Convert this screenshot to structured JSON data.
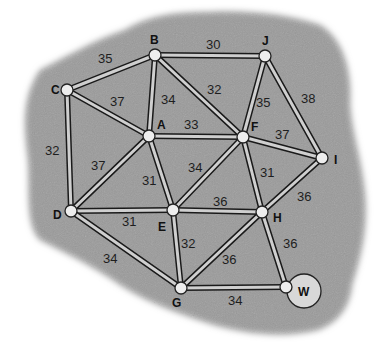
{
  "colors": {
    "background": "#ffffff",
    "region": "#9c9c9c",
    "edge_outline": "#1a1a1a",
    "edge_fill": "#cfcfcf",
    "node_fill": "#ededed"
  },
  "nodes": [
    {
      "id": "B",
      "x": 155,
      "y": 55,
      "lx": 150,
      "ly": 44
    },
    {
      "id": "J",
      "x": 265,
      "y": 56,
      "lx": 262,
      "ly": 45
    },
    {
      "id": "C",
      "x": 67,
      "y": 90,
      "lx": 51,
      "ly": 94
    },
    {
      "id": "A",
      "x": 149,
      "y": 136,
      "lx": 157,
      "ly": 129
    },
    {
      "id": "F",
      "x": 243,
      "y": 137,
      "lx": 251,
      "ly": 131
    },
    {
      "id": "I",
      "x": 322,
      "y": 158,
      "lx": 334,
      "ly": 164
    },
    {
      "id": "D",
      "x": 71,
      "y": 211,
      "lx": 53,
      "ly": 219
    },
    {
      "id": "E",
      "x": 173,
      "y": 210,
      "lx": 158,
      "ly": 231
    },
    {
      "id": "H",
      "x": 262,
      "y": 212,
      "lx": 273,
      "ly": 222
    },
    {
      "id": "G",
      "x": 181,
      "y": 288,
      "lx": 172,
      "ly": 307
    },
    {
      "id": "W",
      "x": 286,
      "y": 287,
      "lx": 298,
      "ly": 296
    }
  ],
  "edges": [
    {
      "from": "C",
      "to": "B",
      "weight": "35",
      "lx": 98,
      "ly": 63
    },
    {
      "from": "B",
      "to": "J",
      "weight": "30",
      "lx": 206,
      "ly": 49
    },
    {
      "from": "C",
      "to": "A",
      "weight": "37",
      "lx": 110,
      "ly": 106
    },
    {
      "from": "B",
      "to": "A",
      "weight": "34",
      "lx": 161,
      "ly": 104
    },
    {
      "from": "B",
      "to": "F",
      "weight": "32",
      "lx": 207,
      "ly": 94
    },
    {
      "from": "J",
      "to": "F",
      "weight": "35",
      "lx": 256,
      "ly": 107
    },
    {
      "from": "J",
      "to": "I",
      "weight": "38",
      "lx": 301,
      "ly": 103
    },
    {
      "from": "A",
      "to": "F",
      "weight": "33",
      "lx": 184,
      "ly": 129
    },
    {
      "from": "F",
      "to": "I",
      "weight": "37",
      "lx": 275,
      "ly": 139
    },
    {
      "from": "C",
      "to": "D",
      "weight": "32",
      "lx": 45,
      "ly": 155
    },
    {
      "from": "A",
      "to": "D",
      "weight": "37",
      "lx": 91,
      "ly": 170
    },
    {
      "from": "A",
      "to": "E",
      "weight": "31",
      "lx": 142,
      "ly": 185
    },
    {
      "from": "F",
      "to": "E",
      "weight": "34",
      "lx": 188,
      "ly": 172
    },
    {
      "from": "F",
      "to": "H",
      "weight": "31",
      "lx": 260,
      "ly": 177
    },
    {
      "from": "D",
      "to": "E",
      "weight": "31",
      "lx": 122,
      "ly": 226
    },
    {
      "from": "E",
      "to": "H",
      "weight": "36",
      "lx": 213,
      "ly": 206
    },
    {
      "from": "I",
      "to": "H",
      "weight": "36",
      "lx": 297,
      "ly": 201
    },
    {
      "from": "D",
      "to": "G",
      "weight": "34",
      "lx": 103,
      "ly": 263
    },
    {
      "from": "E",
      "to": "G",
      "weight": "32",
      "lx": 181,
      "ly": 248
    },
    {
      "from": "H",
      "to": "G",
      "weight": "36",
      "lx": 222,
      "ly": 264
    },
    {
      "from": "H",
      "to": "W",
      "weight": "36",
      "lx": 283,
      "ly": 248
    },
    {
      "from": "G",
      "to": "W",
      "weight": "34",
      "lx": 228,
      "ly": 305
    }
  ]
}
